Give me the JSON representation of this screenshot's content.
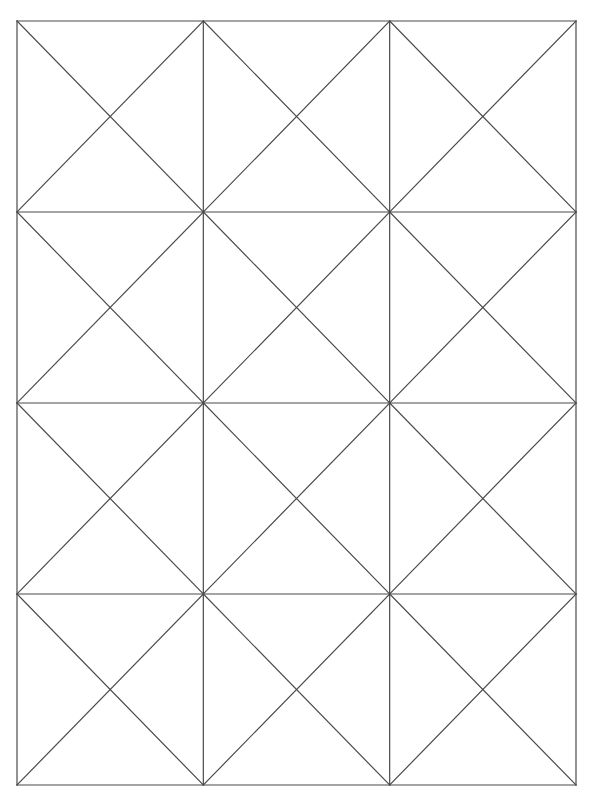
{
  "document": {
    "title": "Geometric Grid Pattern",
    "background_color": "#ffffff",
    "width": 593,
    "height": 802
  },
  "figure": {
    "name": "diagonal-cross-grid",
    "stroke_color": "#4a4a4a",
    "stroke_width": 1.2,
    "fill_color": "none",
    "bounds": {
      "left": 17,
      "top": 21,
      "right": 576,
      "bottom": 785,
      "width": 559,
      "height": 764
    },
    "grid": {
      "columns": 3,
      "rows": 4,
      "cell_width": 186.33,
      "cell_height": 191.0,
      "x_positions": [
        17,
        203.33,
        389.67,
        576
      ],
      "y_positions": [
        21,
        212,
        403,
        594,
        785
      ]
    },
    "cells": [
      {
        "row": 0,
        "col": 0,
        "diagonals": [
          "tl-br",
          "tr-bl"
        ]
      },
      {
        "row": 0,
        "col": 1,
        "diagonals": [
          "tl-br",
          "tr-bl"
        ]
      },
      {
        "row": 0,
        "col": 2,
        "diagonals": [
          "tl-br",
          "tr-bl"
        ]
      },
      {
        "row": 1,
        "col": 0,
        "diagonals": [
          "tl-br",
          "tr-bl"
        ]
      },
      {
        "row": 1,
        "col": 1,
        "diagonals": [
          "tl-br",
          "tr-bl"
        ]
      },
      {
        "row": 1,
        "col": 2,
        "diagonals": [
          "tl-br",
          "tr-bl"
        ]
      },
      {
        "row": 2,
        "col": 0,
        "diagonals": [
          "tl-br",
          "tr-bl"
        ]
      },
      {
        "row": 2,
        "col": 1,
        "diagonals": [
          "tl-br",
          "tr-bl"
        ]
      },
      {
        "row": 2,
        "col": 2,
        "diagonals": [
          "tl-br",
          "tr-bl"
        ]
      },
      {
        "row": 3,
        "col": 0,
        "diagonals": [
          "tl-br",
          "tr-bl"
        ]
      },
      {
        "row": 3,
        "col": 1,
        "diagonals": [
          "tl-br",
          "tr-bl"
        ]
      },
      {
        "row": 3,
        "col": 2,
        "diagonals": [
          "tl-br",
          "tr-bl"
        ]
      }
    ]
  }
}
